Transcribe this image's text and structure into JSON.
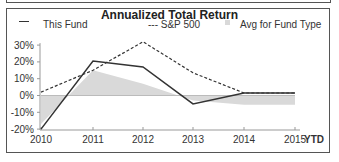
{
  "chart_data": {
    "type": "line",
    "title": "Annualized Total Return",
    "xlabel": "",
    "ylabel": "",
    "categories": [
      "2010",
      "2011",
      "2012",
      "2013",
      "2014",
      "2015"
    ],
    "x_suffix_label": "YTD",
    "ylim": [
      -20,
      30
    ],
    "yticks": [
      "30%",
      "20%",
      "10%",
      "0%",
      "-10%",
      "-20%"
    ],
    "ytick_values": [
      30,
      20,
      10,
      0,
      -10,
      -20
    ],
    "legend_placement": "top",
    "series": [
      {
        "name": "This Fund",
        "style": "solid",
        "color": "#333333",
        "values": [
          -20,
          20.5,
          17,
          -5,
          1.5,
          1.5
        ]
      },
      {
        "name": "S&P 500",
        "style": "dashed",
        "color": "#333333",
        "values": [
          2,
          15,
          32,
          13.5,
          1.5,
          1.5
        ]
      },
      {
        "name": "Avg for Fund Type",
        "style": "area",
        "color": "#d9d9d9",
        "values": [
          -17,
          15,
          7,
          -3,
          -5.5,
          -5.5
        ]
      }
    ]
  },
  "legend": {
    "fund_label": "This Fund",
    "sp_label": "--- S&P 500",
    "avg_label": "Avg for Fund Type"
  }
}
